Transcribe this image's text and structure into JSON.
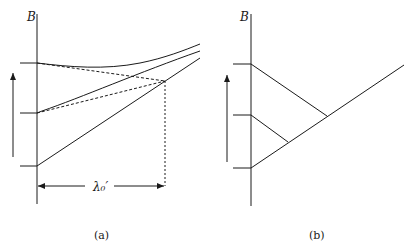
{
  "figure": {
    "panels": [
      {
        "id": "a",
        "caption": "(a)",
        "axis_label": "B",
        "dimension_label": "λ₀′",
        "description": "Three energy levels (ticks on B axis) with solid curves diverging to the right; dashed lines from upper two levels converge at a point whose horizontal distance from axis is λ₀′"
      },
      {
        "id": "b",
        "caption": "(b)",
        "axis_label": "B",
        "description": "Three levels on B axis; lines from top and middle levels descend to meet a rising line from the lowest level"
      }
    ],
    "colors": {
      "ink": "#1a1a1a",
      "background": "#ffffff"
    }
  }
}
